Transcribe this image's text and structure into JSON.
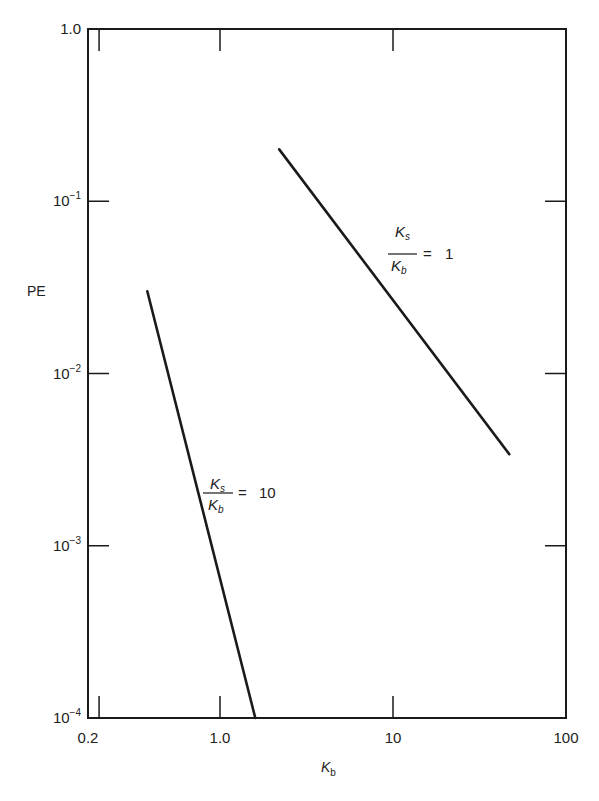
{
  "chart_data": {
    "type": "line",
    "title": "",
    "xlabel": "K_b",
    "ylabel": "PE",
    "xscale": "log",
    "yscale": "log",
    "xlim": [
      0.2,
      100
    ],
    "ylim": [
      0.0001,
      1.0
    ],
    "grid": false,
    "legend": "none (inline annotations)",
    "x_ticks": [
      {
        "value": 0.2,
        "label": "0.2"
      },
      {
        "value": 1.0,
        "label": "1.0"
      },
      {
        "value": 10,
        "label": "10"
      },
      {
        "value": 100,
        "label": "100"
      }
    ],
    "y_ticks": [
      {
        "value": 1.0,
        "label": "1.0",
        "base": "1.0",
        "exp": ""
      },
      {
        "value": 0.1,
        "label": "10^-1",
        "base": "10",
        "exp": "−1"
      },
      {
        "value": 0.01,
        "label": "10^-2",
        "base": "10",
        "exp": "−2"
      },
      {
        "value": 0.001,
        "label": "10^-3",
        "base": "10",
        "exp": "−3"
      },
      {
        "value": 0.0001,
        "label": "10^-4",
        "base": "10",
        "exp": "−4"
      }
    ],
    "series": [
      {
        "name": "Ks/Kb = 1",
        "annotation": {
          "num": "K",
          "num_sub": "s",
          "den": "K",
          "den_sub": "b",
          "eq": "=",
          "value": "1"
        },
        "points": [
          {
            "x": 2.2,
            "y": 0.2
          },
          {
            "x": 47,
            "y": 0.0034
          }
        ]
      },
      {
        "name": "Ks/Kb = 10",
        "annotation": {
          "num": "K",
          "num_sub": "s",
          "den": "K",
          "den_sub": "b",
          "eq": "=",
          "value": "10"
        },
        "points": [
          {
            "x": 0.38,
            "y": 0.03
          },
          {
            "x": 1.6,
            "y": 0.0001
          }
        ]
      }
    ]
  },
  "labels": {
    "y_axis_title": "PE",
    "x_axis_title_base": "K",
    "x_axis_title_sub": "b"
  },
  "colors": {
    "ink": "#1a1a1a",
    "background": "#ffffff"
  }
}
